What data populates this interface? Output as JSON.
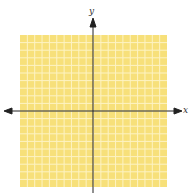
{
  "figure": {
    "type": "coordinate-plane",
    "x_axis_label": "x",
    "y_axis_label": "y",
    "grid": {
      "columns": 20,
      "rows": 20,
      "background_color": "#f7e07a",
      "line_color": "#fdf3c4"
    },
    "axis_color": "#222222"
  }
}
